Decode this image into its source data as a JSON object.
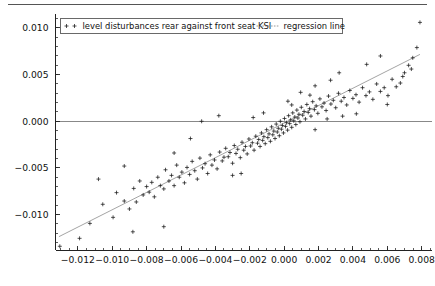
{
  "figure": {
    "background_color": "#ffffff",
    "foreground_color": "#111111",
    "top_rule_color": "#555555"
  },
  "chart_data": {
    "type": "scatter",
    "title": "",
    "subtitle": "",
    "xlabel": "",
    "ylabel": "",
    "xlim": [
      -0.0133,
      0.0086
    ],
    "ylim": [
      -0.0138,
      0.0115
    ],
    "grid": false,
    "legend_position": "top-left",
    "legend": [
      {
        "label": "level disturbances rear against front seat KSI",
        "marker": "plus",
        "style": "markers",
        "color": "#1a1a1a"
      },
      {
        "label": "regression line",
        "marker": "none",
        "style": "dotted-line",
        "color": "#8d8d8d"
      }
    ],
    "xticks": [
      -0.012,
      -0.01,
      -0.008,
      -0.006,
      -0.004,
      -0.002,
      0.0,
      0.002,
      0.004,
      0.006,
      0.008
    ],
    "xticklabels": [
      "-0.012",
      "-0.010",
      "-0.008",
      "-0.006",
      "-0.004",
      "-0.002",
      "0.000",
      "0.002",
      "0.004",
      "0.006",
      "0.008"
    ],
    "yticks": [
      -0.01,
      -0.005,
      0.0,
      0.005,
      0.01
    ],
    "yticklabels": [
      "-0.010",
      "-0.005",
      "0.000",
      "0.005",
      "0.010"
    ],
    "x_minor_tick_step": 0.0005,
    "y_minor_tick_step": 0.001,
    "reference_lines": [
      {
        "orientation": "horizontal",
        "value": 0.0,
        "color": "#888888"
      }
    ],
    "regression_line": {
      "slope": 0.93,
      "intercept": -0.00018,
      "x_start": -0.0131,
      "x_end": 0.0079,
      "y_start": -0.01237,
      "y_end": 0.00717,
      "color": "#8d8d8d",
      "style": "solid-thin"
    },
    "series": [
      {
        "name": "level disturbances rear against front seat KSI",
        "marker": "plus",
        "color": "#1a1a1a",
        "points": [
          [
            -0.01305,
            -0.0134
          ],
          [
            -0.0113,
            -0.01095
          ],
          [
            -0.01055,
            -0.0089
          ],
          [
            -0.00995,
            -0.0103
          ],
          [
            -0.00975,
            -0.00765
          ],
          [
            -0.0093,
            -0.00855
          ],
          [
            -0.009,
            -0.0094
          ],
          [
            -0.00875,
            -0.0072
          ],
          [
            -0.0086,
            -0.00865
          ],
          [
            -0.0084,
            -0.0064
          ],
          [
            -0.0082,
            -0.0079
          ],
          [
            -0.008,
            -0.007
          ],
          [
            -0.00785,
            -0.0076
          ],
          [
            -0.0077,
            -0.00655
          ],
          [
            -0.00755,
            -0.0081
          ],
          [
            -0.00735,
            -0.006
          ],
          [
            -0.0072,
            -0.0069
          ],
          [
            -0.007,
            -0.00725
          ],
          [
            -0.0069,
            -0.0052
          ],
          [
            -0.0067,
            -0.0064
          ],
          [
            -0.00655,
            -0.0058
          ],
          [
            -0.0064,
            -0.0069
          ],
          [
            -0.00625,
            -0.0047
          ],
          [
            -0.0061,
            -0.006
          ],
          [
            -0.00595,
            -0.00545
          ],
          [
            -0.0058,
            -0.0066
          ],
          [
            -0.00565,
            -0.00495
          ],
          [
            -0.0055,
            -0.0057
          ],
          [
            -0.00535,
            -0.0043
          ],
          [
            -0.0052,
            -0.0053
          ],
          [
            -0.00505,
            -0.0062
          ],
          [
            -0.0049,
            -0.00395
          ],
          [
            -0.00475,
            -0.005
          ],
          [
            -0.0046,
            -0.00455
          ],
          [
            -0.00445,
            -0.0056
          ],
          [
            -0.0043,
            -0.0036
          ],
          [
            -0.0042,
            -0.0047
          ],
          [
            -0.00405,
            -0.00415
          ],
          [
            -0.0039,
            -0.0051
          ],
          [
            -0.00375,
            -0.0033
          ],
          [
            -0.0036,
            -0.00425
          ],
          [
            -0.0035,
            -0.00385
          ],
          [
            -0.0034,
            -0.0029
          ],
          [
            -0.00325,
            -0.0038
          ],
          [
            -0.00315,
            -0.00335
          ],
          [
            -0.003,
            -0.0045
          ],
          [
            -0.0029,
            -0.0026
          ],
          [
            -0.0028,
            -0.00345
          ],
          [
            -0.0027,
            -0.003
          ],
          [
            -0.00255,
            -0.0039
          ],
          [
            -0.00245,
            -0.00225
          ],
          [
            -0.00235,
            -0.0031
          ],
          [
            -0.00225,
            -0.0027
          ],
          [
            -0.00215,
            -0.0035
          ],
          [
            -0.00205,
            -0.0019
          ],
          [
            -0.00195,
            -0.00265
          ],
          [
            -0.00185,
            -0.0023
          ],
          [
            -0.00175,
            -0.0031
          ],
          [
            -0.00165,
            -0.0016
          ],
          [
            -0.00155,
            -0.00235
          ],
          [
            -0.00148,
            -0.00195
          ],
          [
            -0.0014,
            -0.0027
          ],
          [
            -0.00132,
            -0.00125
          ],
          [
            -0.00125,
            -0.00205
          ],
          [
            -0.00118,
            -0.00165
          ],
          [
            -0.0011,
            -0.0024
          ],
          [
            -0.00102,
            -0.0009
          ],
          [
            -0.00095,
            -0.00175
          ],
          [
            -0.00088,
            -0.00135
          ],
          [
            -0.0008,
            -0.00215
          ],
          [
            -0.00073,
            -0.0006
          ],
          [
            -0.00066,
            -0.00145
          ],
          [
            -0.0006,
            -0.00105
          ],
          [
            -0.00053,
            -0.00185
          ],
          [
            -0.00046,
            -0.0003
          ],
          [
            -0.0004,
            -0.00115
          ],
          [
            -0.00034,
            -0.00075
          ],
          [
            -0.00028,
            -0.00155
          ],
          [
            -0.00022,
            0.0
          ],
          [
            -0.00016,
            -0.00085
          ],
          [
            -0.0001,
            -0.00045
          ],
          [
            -4e-05,
            -0.00125
          ],
          [
            2e-05,
            0.0003
          ],
          [
            8e-05,
            -0.00055
          ],
          [
            0.00014,
            -0.00015
          ],
          [
            0.0002,
            -0.00095
          ],
          [
            0.00026,
            0.0006
          ],
          [
            0.00032,
            -0.00025
          ],
          [
            0.00038,
            0.00015
          ],
          [
            0.00044,
            -0.00065
          ],
          [
            0.0005,
            0.0009
          ],
          [
            0.00056,
            5e-05
          ],
          [
            0.00062,
            0.00045
          ],
          [
            0.00068,
            -0.00035
          ],
          [
            0.00074,
            0.0012
          ],
          [
            0.0008,
            0.00035
          ],
          [
            0.00086,
            0.00075
          ],
          [
            0.00092,
            -5e-05
          ],
          [
            0.001,
            0.0015
          ],
          [
            0.00108,
            0.00065
          ],
          [
            0.00116,
            0.00105
          ],
          [
            0.00124,
            0.00025
          ],
          [
            0.00132,
            0.0018
          ],
          [
            0.0014,
            0.00095
          ],
          [
            0.00148,
            0.00135
          ],
          [
            0.00156,
            0.00055
          ],
          [
            0.00166,
            0.0021
          ],
          [
            0.00176,
            0.00125
          ],
          [
            0.00186,
            0.00165
          ],
          [
            0.00196,
            0.00085
          ],
          [
            0.00208,
            0.0024
          ],
          [
            0.0022,
            0.00155
          ],
          [
            0.00232,
            0.00195
          ],
          [
            0.00244,
            0.00115
          ],
          [
            0.00258,
            0.0027
          ],
          [
            0.00272,
            0.00185
          ],
          [
            0.00286,
            0.00225
          ],
          [
            0.003,
            0.00145
          ],
          [
            0.00316,
            0.003
          ],
          [
            0.00332,
            0.00215
          ],
          [
            0.00348,
            0.00255
          ],
          [
            0.00364,
            0.00175
          ],
          [
            0.00382,
            0.0033
          ],
          [
            0.004,
            0.00245
          ],
          [
            0.00418,
            0.00285
          ],
          [
            0.00436,
            0.00205
          ],
          [
            0.00456,
            0.0036
          ],
          [
            0.00476,
            0.00275
          ],
          [
            0.00496,
            0.00315
          ],
          [
            0.00516,
            0.00235
          ],
          [
            0.00538,
            0.004
          ],
          [
            0.0056,
            0.0032
          ],
          [
            0.00582,
            0.0036
          ],
          [
            0.00604,
            0.00275
          ],
          [
            0.00628,
            0.0045
          ],
          [
            0.00652,
            0.0037
          ],
          [
            0.00676,
            0.0041
          ],
          [
            0.007,
            0.0052
          ],
          [
            0.00724,
            0.006
          ],
          [
            0.00748,
            0.0068
          ],
          [
            0.00772,
            0.0079
          ],
          [
            0.0079,
            0.0106
          ],
          [
            -0.0048,
            0.0
          ],
          [
            -0.003,
            -0.0058
          ],
          [
            -0.0064,
            -0.0034
          ],
          [
            -0.0025,
            -0.0056
          ],
          [
            0.0018,
            -0.0009
          ],
          [
            0.0042,
            0.0008
          ],
          [
            0.006,
            0.0018
          ],
          [
            0.0018,
            0.0038
          ],
          [
            0.0032,
            0.0052
          ],
          [
            0.0048,
            0.0061
          ],
          [
            0.0056,
            0.007
          ],
          [
            -0.0088,
            -0.01185
          ],
          [
            -0.007,
            -0.0113
          ],
          [
            -0.0119,
            -0.01255
          ],
          [
            0.00096,
            0.0031
          ],
          [
            0.00022,
            0.00215
          ],
          [
            -0.0012,
            0.0009
          ],
          [
            -0.0038,
            0.0006
          ],
          [
            -0.00545,
            -0.00185
          ],
          [
            0.0027,
            0.0044
          ],
          [
            0.0015,
            0.0028
          ],
          [
            0.0069,
            0.0048
          ],
          [
            0.0074,
            0.0056
          ],
          [
            0.0025,
            0.00025
          ],
          [
            0.0034,
            0.00055
          ],
          [
            -0.0093,
            -0.0048
          ],
          [
            -0.0108,
            -0.0062
          ],
          [
            0.00044,
            0.00175
          ],
          [
            -0.0018,
            0.0004
          ]
        ]
      }
    ]
  }
}
